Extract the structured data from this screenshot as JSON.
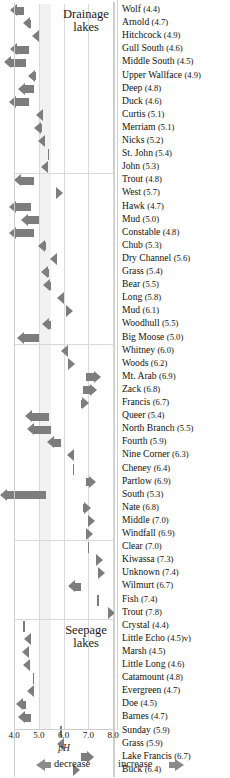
{
  "chart_data": {
    "type": "bar",
    "title": "",
    "xlabel": "pH",
    "ylabel": "",
    "xlim": [
      4.0,
      8.0
    ],
    "xticks": [
      "4.0",
      "5.0",
      "6.0",
      "7.0",
      "8.0"
    ],
    "grid": true,
    "orientation": "horizontal",
    "legend_position": "bottom",
    "legend": [
      "decrease",
      "increase"
    ],
    "shaded_band": [
      5.0,
      5.5
    ],
    "groups": [
      {
        "name": "Drainage lakes",
        "label_line1": "Drainage",
        "label_line2": "lakes",
        "items": [
          {
            "label": "Wolf",
            "ph": "4.4",
            "value": 4.4,
            "direction": "decrease",
            "magnitude": 0.55
          },
          {
            "label": "Arnold",
            "ph": "4.7",
            "value": 4.7,
            "direction": "decrease",
            "magnitude": 0.35
          },
          {
            "label": "Hitchcock",
            "ph": "4.9",
            "value": 4.9,
            "direction": "decrease",
            "magnitude": 0.17
          },
          {
            "label": "Gull South",
            "ph": "4.6",
            "value": 4.6,
            "direction": "decrease",
            "magnitude": 0.75
          },
          {
            "label": "Middle South",
            "ph": "4.5",
            "value": 4.5,
            "direction": "decrease",
            "magnitude": 0.9
          },
          {
            "label": "Upper Wallface",
            "ph": "4.9",
            "value": 4.9,
            "direction": "decrease",
            "magnitude": 0.33
          },
          {
            "label": "Deep",
            "ph": "4.8",
            "value": 4.8,
            "direction": "decrease",
            "magnitude": 0.62
          },
          {
            "label": "Duck",
            "ph": "4.6",
            "value": 4.6,
            "direction": "decrease",
            "magnitude": 0.8
          },
          {
            "label": "Curtis",
            "ph": "5.1",
            "value": 5.1,
            "direction": "decrease",
            "magnitude": 0.2
          },
          {
            "label": "Merriam",
            "ph": "5.1",
            "value": 5.1,
            "direction": "decrease",
            "magnitude": 0.3
          },
          {
            "label": "Nicks",
            "ph": "5.2",
            "value": 5.2,
            "direction": "decrease",
            "magnitude": 0.22
          },
          {
            "label": "St. John",
            "ph": "5.4",
            "value": 5.4,
            "direction": "none",
            "magnitude": 0.0
          },
          {
            "label": "John",
            "ph": "5.3",
            "value": 5.3,
            "direction": "decrease",
            "magnitude": 0.2
          }
        ]
      },
      {
        "name": "Drainage lakes group 2",
        "label_line1": "",
        "label_line2": "",
        "items": [
          {
            "label": "Trout",
            "ph": "4.8",
            "value": 4.8,
            "direction": "decrease",
            "magnitude": 0.82
          },
          {
            "label": "West",
            "ph": "5.7",
            "value": 5.7,
            "direction": "increase",
            "magnitude": 0.06
          },
          {
            "label": "Hawk",
            "ph": "4.7",
            "value": 4.7,
            "direction": "decrease",
            "magnitude": 0.9
          },
          {
            "label": "Mud",
            "ph": "5.0",
            "value": 5.0,
            "direction": "decrease",
            "magnitude": 0.72
          },
          {
            "label": "Constable",
            "ph": "4.8",
            "value": 4.8,
            "direction": "decrease",
            "magnitude": 1.0
          },
          {
            "label": "Chub",
            "ph": "5.3",
            "value": 5.3,
            "direction": "decrease",
            "magnitude": 0.32
          },
          {
            "label": "Dry Channel",
            "ph": "5.6",
            "value": 5.6,
            "direction": "decrease",
            "magnitude": 0.14
          },
          {
            "label": "Grass",
            "ph": "5.4",
            "value": 5.4,
            "direction": "decrease",
            "magnitude": 0.3
          },
          {
            "label": "Bear",
            "ph": "5.5",
            "value": 5.5,
            "direction": "decrease",
            "magnitude": 0.33
          },
          {
            "label": "Long",
            "ph": "5.8",
            "value": 5.8,
            "direction": "decrease",
            "magnitude": 0.08
          },
          {
            "label": "Mud",
            "ph": "6.1",
            "value": 6.1,
            "direction": "increase",
            "magnitude": 0.12
          },
          {
            "label": "Woodhull",
            "ph": "5.5",
            "value": 5.5,
            "direction": "decrease",
            "magnitude": 0.36
          },
          {
            "label": "Big Moose",
            "ph": "5.0",
            "value": 5.0,
            "direction": "decrease",
            "magnitude": 0.86
          }
        ]
      },
      {
        "name": "Drainage lakes group 3",
        "label_line1": "",
        "label_line2": "",
        "items": [
          {
            "label": "Whitney",
            "ph": "6.0",
            "value": 6.0,
            "direction": "decrease",
            "magnitude": 0.1
          },
          {
            "label": "Woods",
            "ph": "6.2",
            "value": 6.2,
            "direction": "increase",
            "magnitude": 0.05
          },
          {
            "label": "Mt. Arab",
            "ph": "6.9",
            "value": 6.9,
            "direction": "increase",
            "magnitude": 0.6
          },
          {
            "label": "Zack",
            "ph": "6.8",
            "value": 6.8,
            "direction": "increase",
            "magnitude": 0.56
          },
          {
            "label": "Francis",
            "ph": "6.7",
            "value": 6.7,
            "direction": "increase",
            "magnitude": 0.34
          },
          {
            "label": "Queer",
            "ph": "5.4",
            "value": 5.4,
            "direction": "decrease",
            "magnitude": 0.95
          },
          {
            "label": "North Branch",
            "ph": "5.5",
            "value": 5.5,
            "direction": "decrease",
            "magnitude": 0.98
          },
          {
            "label": "Fourth",
            "ph": "5.9",
            "value": 5.9,
            "direction": "decrease",
            "magnitude": 0.55
          },
          {
            "label": "Nine Corner",
            "ph": "6.3",
            "value": 6.3,
            "direction": "decrease",
            "magnitude": 0.15
          },
          {
            "label": "Cheney",
            "ph": "6.4",
            "value": 6.4,
            "direction": "none",
            "magnitude": 0.0
          },
          {
            "label": "Partlow",
            "ph": "6.9",
            "value": 6.9,
            "direction": "increase",
            "magnitude": 0.4
          },
          {
            "label": "South",
            "ph": "5.3",
            "value": 5.3,
            "direction": "decrease",
            "magnitude": 1.85
          },
          {
            "label": "Nate",
            "ph": "6.8",
            "value": 6.8,
            "direction": "increase",
            "magnitude": 0.3
          },
          {
            "label": "Middle",
            "ph": "7.0",
            "value": 7.0,
            "direction": "increase",
            "magnitude": 0.16
          },
          {
            "label": "Windfall",
            "ph": "6.9",
            "value": 6.9,
            "direction": "increase",
            "magnitude": 0.13
          }
        ]
      },
      {
        "name": "Drainage lakes group 4",
        "label_line1": "",
        "label_line2": "",
        "items": [
          {
            "label": "Clear",
            "ph": "7.0",
            "value": 7.0,
            "direction": "none",
            "magnitude": 0.0
          },
          {
            "label": "Kiwassa",
            "ph": "7.3",
            "value": 7.3,
            "direction": "increase",
            "magnitude": 0.2
          },
          {
            "label": "Unknown",
            "ph": "7.4",
            "value": 7.4,
            "direction": "increase",
            "magnitude": 0.24
          },
          {
            "label": "Wilmurt",
            "ph": "6.7",
            "value": 6.7,
            "direction": "decrease",
            "magnitude": 0.5
          },
          {
            "label": "Fish",
            "ph": "7.4",
            "value": 7.4,
            "direction": "none",
            "magnitude": 0.0
          },
          {
            "label": "Trout",
            "ph": "7.8",
            "value": 7.8,
            "direction": "increase",
            "magnitude": 0.28
          }
        ]
      },
      {
        "name": "Seepage lakes",
        "label_line1": "Seepage",
        "label_line2": "lakes",
        "items": [
          {
            "label": "Crystal",
            "ph": "4.4",
            "value": 4.4,
            "direction": "none",
            "magnitude": 0.0
          },
          {
            "label": "Little Echo",
            "ph": "4.5)v",
            "value": 4.5,
            "direction": "decrease",
            "magnitude": 0.05
          },
          {
            "label": "Marsh",
            "ph": "4.5",
            "value": 4.5,
            "direction": "decrease",
            "magnitude": 0.17
          },
          {
            "label": "Little Long",
            "ph": "4.6",
            "value": 4.6,
            "direction": "decrease",
            "magnitude": 0.22
          },
          {
            "label": "Catamount",
            "ph": "4.8",
            "value": 4.8,
            "direction": "none",
            "magnitude": 0.0
          },
          {
            "label": "Evergreen",
            "ph": "4.7",
            "value": 4.7,
            "direction": "decrease",
            "magnitude": 0.18
          },
          {
            "label": "Doe",
            "ph": "4.5",
            "value": 4.5,
            "direction": "decrease",
            "magnitude": 0.4
          },
          {
            "label": "Barnes",
            "ph": "4.7",
            "value": 4.7,
            "direction": "decrease",
            "magnitude": 0.52
          },
          {
            "label": "Sunday",
            "ph": "5.9",
            "value": 5.9,
            "direction": "none",
            "magnitude": 0.0
          },
          {
            "label": "Grass",
            "ph": "5.9",
            "value": 5.9,
            "direction": "decrease",
            "magnitude": 0.18
          },
          {
            "label": "Lake Francis",
            "ph": "6.7",
            "value": 6.7,
            "direction": "increase",
            "magnitude": 0.52
          },
          {
            "label": "Buck",
            "ph": "6.4",
            "value": 6.4,
            "direction": "increase",
            "magnitude": 0.04
          }
        ]
      }
    ]
  }
}
